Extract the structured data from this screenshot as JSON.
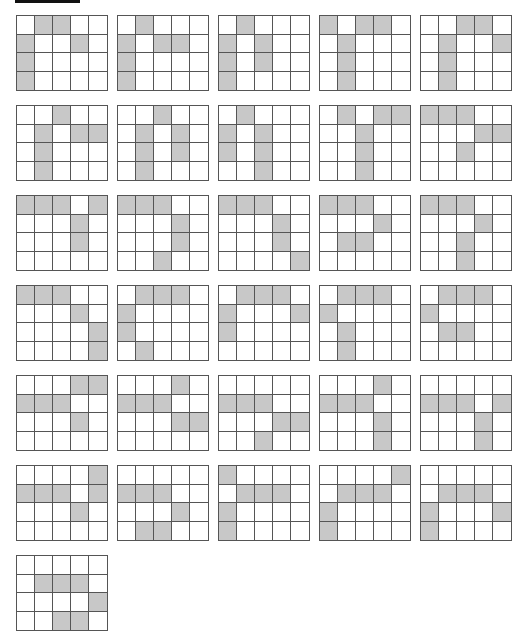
{
  "colors": {
    "filled": "#c8c8c8",
    "empty": "#ffffff",
    "line": "#555555",
    "bar": "#111111"
  },
  "layout": {
    "origin_x": 16,
    "origin_y": 15,
    "pitch_x": 101,
    "pitch_y": 90,
    "per_row": 5,
    "rows": 4,
    "cols": 5
  },
  "grids": [
    [
      [
        0,
        1,
        1,
        0,
        0
      ],
      [
        1,
        0,
        0,
        1,
        0
      ],
      [
        1,
        0,
        0,
        0,
        0
      ],
      [
        1,
        0,
        0,
        0,
        0
      ]
    ],
    [
      [
        0,
        1,
        0,
        0,
        0
      ],
      [
        1,
        0,
        1,
        1,
        0
      ],
      [
        1,
        0,
        0,
        0,
        0
      ],
      [
        1,
        0,
        0,
        0,
        0
      ]
    ],
    [
      [
        0,
        1,
        0,
        0,
        0
      ],
      [
        1,
        0,
        1,
        0,
        0
      ],
      [
        1,
        0,
        1,
        0,
        0
      ],
      [
        1,
        0,
        0,
        0,
        0
      ]
    ],
    [
      [
        1,
        0,
        1,
        1,
        0
      ],
      [
        0,
        1,
        0,
        0,
        0
      ],
      [
        0,
        1,
        0,
        0,
        0
      ],
      [
        0,
        1,
        0,
        0,
        0
      ]
    ],
    [
      [
        0,
        0,
        1,
        1,
        0
      ],
      [
        0,
        1,
        0,
        0,
        1
      ],
      [
        0,
        1,
        0,
        0,
        0
      ],
      [
        0,
        1,
        0,
        0,
        0
      ]
    ],
    [
      [
        0,
        0,
        1,
        0,
        0
      ],
      [
        0,
        1,
        0,
        1,
        1
      ],
      [
        0,
        1,
        0,
        0,
        0
      ],
      [
        0,
        1,
        0,
        0,
        0
      ]
    ],
    [
      [
        0,
        0,
        1,
        0,
        0
      ],
      [
        0,
        1,
        0,
        1,
        0
      ],
      [
        0,
        1,
        0,
        1,
        0
      ],
      [
        0,
        1,
        0,
        0,
        0
      ]
    ],
    [
      [
        0,
        1,
        0,
        0,
        0
      ],
      [
        1,
        0,
        1,
        0,
        0
      ],
      [
        1,
        0,
        1,
        0,
        0
      ],
      [
        0,
        0,
        1,
        0,
        0
      ]
    ],
    [
      [
        0,
        1,
        0,
        1,
        1
      ],
      [
        0,
        0,
        1,
        0,
        0
      ],
      [
        0,
        0,
        1,
        0,
        0
      ],
      [
        0,
        0,
        1,
        0,
        0
      ]
    ],
    [
      [
        1,
        1,
        1,
        0,
        0
      ],
      [
        0,
        0,
        0,
        1,
        1
      ],
      [
        0,
        0,
        1,
        0,
        0
      ],
      [
        0,
        0,
        0,
        0,
        0
      ]
    ],
    [
      [
        1,
        1,
        1,
        0,
        1
      ],
      [
        0,
        0,
        0,
        1,
        0
      ],
      [
        0,
        0,
        0,
        1,
        0
      ],
      [
        0,
        0,
        0,
        0,
        0
      ]
    ],
    [
      [
        1,
        1,
        1,
        0,
        0
      ],
      [
        0,
        0,
        0,
        1,
        0
      ],
      [
        0,
        0,
        0,
        1,
        0
      ],
      [
        0,
        0,
        1,
        0,
        0
      ]
    ],
    [
      [
        1,
        1,
        1,
        0,
        0
      ],
      [
        0,
        0,
        0,
        1,
        0
      ],
      [
        0,
        0,
        0,
        1,
        0
      ],
      [
        0,
        0,
        0,
        0,
        1
      ]
    ],
    [
      [
        1,
        1,
        1,
        0,
        0
      ],
      [
        0,
        0,
        0,
        1,
        0
      ],
      [
        0,
        1,
        1,
        0,
        0
      ],
      [
        0,
        0,
        0,
        0,
        0
      ]
    ],
    [
      [
        1,
        1,
        1,
        0,
        0
      ],
      [
        0,
        0,
        0,
        1,
        0
      ],
      [
        0,
        0,
        1,
        0,
        0
      ],
      [
        0,
        0,
        1,
        0,
        0
      ]
    ],
    [
      [
        1,
        1,
        1,
        0,
        0
      ],
      [
        0,
        0,
        0,
        1,
        0
      ],
      [
        0,
        0,
        0,
        0,
        1
      ],
      [
        0,
        0,
        0,
        0,
        1
      ]
    ],
    [
      [
        0,
        1,
        1,
        1,
        0
      ],
      [
        1,
        0,
        0,
        0,
        0
      ],
      [
        1,
        0,
        0,
        0,
        0
      ],
      [
        0,
        1,
        0,
        0,
        0
      ]
    ],
    [
      [
        0,
        1,
        1,
        1,
        0
      ],
      [
        1,
        0,
        0,
        0,
        1
      ],
      [
        1,
        0,
        0,
        0,
        0
      ],
      [
        0,
        0,
        0,
        0,
        0
      ]
    ],
    [
      [
        0,
        1,
        1,
        1,
        0
      ],
      [
        1,
        0,
        0,
        0,
        0
      ],
      [
        0,
        1,
        0,
        0,
        0
      ],
      [
        0,
        1,
        0,
        0,
        0
      ]
    ],
    [
      [
        0,
        1,
        1,
        1,
        0
      ],
      [
        1,
        0,
        0,
        0,
        0
      ],
      [
        0,
        1,
        1,
        0,
        0
      ],
      [
        0,
        0,
        0,
        0,
        0
      ]
    ],
    [
      [
        0,
        0,
        0,
        1,
        1
      ],
      [
        1,
        1,
        1,
        0,
        0
      ],
      [
        0,
        0,
        0,
        1,
        0
      ],
      [
        0,
        0,
        0,
        0,
        0
      ]
    ],
    [
      [
        0,
        0,
        0,
        1,
        0
      ],
      [
        1,
        1,
        1,
        0,
        0
      ],
      [
        0,
        0,
        0,
        1,
        1
      ],
      [
        0,
        0,
        0,
        0,
        0
      ]
    ],
    [
      [
        0,
        0,
        0,
        0,
        0
      ],
      [
        1,
        1,
        1,
        0,
        0
      ],
      [
        0,
        0,
        0,
        1,
        1
      ],
      [
        0,
        0,
        1,
        0,
        0
      ]
    ],
    [
      [
        0,
        0,
        0,
        1,
        0
      ],
      [
        1,
        1,
        1,
        0,
        0
      ],
      [
        0,
        0,
        0,
        1,
        0
      ],
      [
        0,
        0,
        0,
        1,
        0
      ]
    ],
    [
      [
        0,
        0,
        0,
        0,
        0
      ],
      [
        1,
        1,
        1,
        0,
        1
      ],
      [
        0,
        0,
        0,
        1,
        0
      ],
      [
        0,
        0,
        0,
        1,
        0
      ]
    ],
    [
      [
        0,
        0,
        0,
        0,
        1
      ],
      [
        1,
        1,
        1,
        0,
        1
      ],
      [
        0,
        0,
        0,
        1,
        0
      ],
      [
        0,
        0,
        0,
        0,
        0
      ]
    ],
    [
      [
        0,
        0,
        0,
        0,
        0
      ],
      [
        1,
        1,
        1,
        0,
        0
      ],
      [
        0,
        0,
        0,
        1,
        0
      ],
      [
        0,
        1,
        1,
        0,
        0
      ]
    ],
    [
      [
        1,
        0,
        0,
        0,
        0
      ],
      [
        0,
        1,
        1,
        1,
        0
      ],
      [
        1,
        0,
        0,
        0,
        0
      ],
      [
        1,
        0,
        0,
        0,
        0
      ]
    ],
    [
      [
        0,
        0,
        0,
        0,
        1
      ],
      [
        0,
        1,
        1,
        1,
        0
      ],
      [
        1,
        0,
        0,
        0,
        0
      ],
      [
        1,
        0,
        0,
        0,
        0
      ]
    ],
    [
      [
        0,
        0,
        0,
        0,
        0
      ],
      [
        0,
        1,
        1,
        1,
        0
      ],
      [
        1,
        0,
        0,
        0,
        1
      ],
      [
        1,
        0,
        0,
        0,
        0
      ]
    ],
    [
      [
        0,
        0,
        0,
        0,
        0
      ],
      [
        0,
        1,
        1,
        1,
        0
      ],
      [
        0,
        0,
        0,
        0,
        1
      ],
      [
        0,
        0,
        1,
        1,
        0
      ]
    ]
  ]
}
